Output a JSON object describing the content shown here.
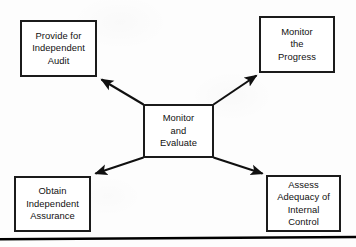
{
  "diagram": {
    "type": "radial-flow",
    "title": "Monitor and Evaluate",
    "center_node": {
      "id": "monitor-and-evaluate",
      "label": "Monitor\nand\nEvaluate"
    },
    "outer_nodes": [
      {
        "id": "provide-for-independent-audit",
        "position": "top-left",
        "label": "Provide for\nIndependent\nAudit"
      },
      {
        "id": "monitor-the-progress",
        "position": "top-right",
        "label": "Monitor\nthe\nProgress"
      },
      {
        "id": "obtain-independent-assurance",
        "position": "bottom-left",
        "label": "Obtain\nIndependent\nAssurance"
      },
      {
        "id": "assess-adequacy-of-internal-control",
        "position": "bottom-right",
        "label": "Assess\nAdequacy of\nInternal\nControl"
      }
    ],
    "connectors": [
      {
        "id": "arrow-to-provide-for-independent-audit",
        "from": "monitor-and-evaluate",
        "to": "provide-for-independent-audit",
        "direction": "outward",
        "arrowhead": "filled-triangle"
      },
      {
        "id": "arrow-to-monitor-the-progress",
        "from": "monitor-and-evaluate",
        "to": "monitor-the-progress",
        "direction": "outward",
        "arrowhead": "filled-triangle"
      },
      {
        "id": "arrow-to-obtain-independent-assurance",
        "from": "monitor-and-evaluate",
        "to": "obtain-independent-assurance",
        "direction": "outward",
        "arrowhead": "filled-triangle"
      },
      {
        "id": "arrow-to-assess-adequacy-of-internal-control",
        "from": "monitor-and-evaluate",
        "to": "assess-adequacy-of-internal-control",
        "direction": "outward",
        "arrowhead": "filled-triangle"
      }
    ]
  },
  "colors": {
    "ink": "#1b1b1b",
    "text": "#111111",
    "box_fill": "#ffffff",
    "page_background": "#fdfdfd",
    "rule": "#000000"
  }
}
